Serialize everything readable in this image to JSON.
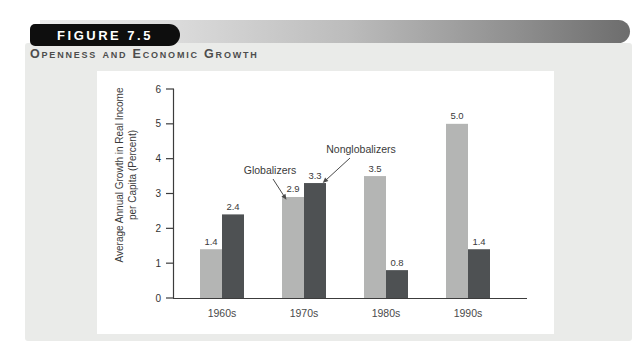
{
  "figure_header": {
    "badge_label": "FIGURE 7.5",
    "subtitle": "Openness and Economic Growth"
  },
  "colors": {
    "badge_bg": "#0e0e0e",
    "badge_text": "#ffffff",
    "panel_bg": "#eaebe9",
    "chart_bg": "#ffffff",
    "axis": "#3c3c3c",
    "tick_label": "#333333",
    "value_label": "#3a3a3a",
    "globalizers_bar": "#b4b5b4",
    "nonglobalizers_bar": "#4e5153"
  },
  "chart_data": {
    "type": "bar",
    "title": "Openness and Economic Growth",
    "categories": [
      "1960s",
      "1970s",
      "1980s",
      "1990s"
    ],
    "series": [
      {
        "name": "Globalizers",
        "values": [
          1.4,
          2.9,
          3.5,
          5.0
        ],
        "labels": [
          "1.4",
          "2.9",
          "3.5",
          "5.0"
        ],
        "color": "#b4b5b4"
      },
      {
        "name": "Nonglobalizers",
        "values": [
          2.4,
          3.3,
          0.8,
          1.4
        ],
        "labels": [
          "2.4",
          "3.3",
          "0.8",
          "1.4"
        ],
        "color": "#4e5153"
      }
    ],
    "ylabel": "Average Annual Growth in Real Income per Capita (Percent)",
    "ylabel_lines": [
      "Average Annual Growth in Real Income",
      "per Capita (Percent)"
    ],
    "xlabel": "",
    "ylim": [
      0,
      6
    ],
    "yticks": [
      0,
      1,
      2,
      3,
      4,
      5,
      6
    ],
    "grid": false,
    "legend": "inline-annotations",
    "annotations": [
      {
        "text": "Globalizers",
        "series": "Globalizers",
        "category": "1970s",
        "target_corner": "top-left"
      },
      {
        "text": "Nonglobalizers",
        "series": "Nonglobalizers",
        "category": "1970s",
        "target_corner": "top-right"
      }
    ]
  }
}
